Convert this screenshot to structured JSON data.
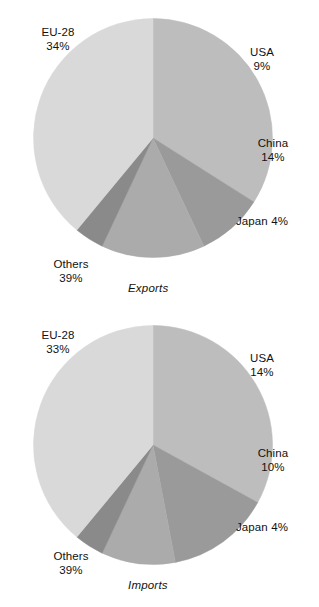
{
  "chart_data": [
    {
      "type": "pie",
      "title": "Exports",
      "caption": "Exports",
      "categories": [
        "EU-28",
        "USA",
        "China",
        "Japan",
        "Others"
      ],
      "values": [
        34,
        9,
        14,
        4,
        39
      ],
      "value_labels": [
        "34%",
        "9%",
        "14%",
        "4%",
        "39%"
      ],
      "unit": "%",
      "colors": [
        "#bdbdbd",
        "#9a9a9a",
        "#ababab",
        "#8a8a8a",
        "#d9d9d9"
      ],
      "legend": "none",
      "labels_position": "outside-callout",
      "start_angle_deg": 0,
      "direction": "clockwise",
      "slices": [
        {
          "name": "EU-28",
          "value": 34,
          "label": "EU-28",
          "pct": "34%",
          "color": "#bdbdbd"
        },
        {
          "name": "USA",
          "value": 9,
          "label": "USA",
          "pct": "9%",
          "color": "#9a9a9a"
        },
        {
          "name": "China",
          "value": 14,
          "label": "China",
          "pct": "14%",
          "color": "#ababab"
        },
        {
          "name": "Japan",
          "value": 4,
          "label": "Japan",
          "pct": "4%",
          "color": "#8a8a8a"
        },
        {
          "name": "Others",
          "value": 39,
          "label": "Others",
          "pct": "39%",
          "color": "#d9d9d9"
        }
      ]
    },
    {
      "type": "pie",
      "title": "Imports",
      "caption": "Imports",
      "categories": [
        "EU-28",
        "USA",
        "China",
        "Japan",
        "Others"
      ],
      "values": [
        33,
        14,
        10,
        4,
        39
      ],
      "value_labels": [
        "33%",
        "14%",
        "10%",
        "4%",
        "39%"
      ],
      "unit": "%",
      "colors": [
        "#bdbdbd",
        "#9a9a9a",
        "#ababab",
        "#8a8a8a",
        "#d9d9d9"
      ],
      "legend": "none",
      "labels_position": "outside-callout",
      "start_angle_deg": 0,
      "direction": "clockwise",
      "slices": [
        {
          "name": "EU-28",
          "value": 33,
          "label": "EU-28",
          "pct": "33%",
          "color": "#bdbdbd"
        },
        {
          "name": "USA",
          "value": 14,
          "label": "USA",
          "pct": "14%",
          "color": "#9a9a9a"
        },
        {
          "name": "China",
          "value": 10,
          "label": "China",
          "pct": "10%",
          "color": "#ababab"
        },
        {
          "name": "Japan",
          "value": 4,
          "label": "Japan",
          "pct": "4%",
          "color": "#8a8a8a"
        },
        {
          "name": "Others",
          "value": 39,
          "label": "Others",
          "pct": "39%",
          "color": "#d9d9d9"
        }
      ]
    }
  ],
  "exports": {
    "caption": "Exports",
    "labels": {
      "eu_name": "EU-28",
      "eu_pct": "34%",
      "usa_name": "USA",
      "usa_pct": "9%",
      "china_name": "China",
      "china_pct": "14%",
      "japan_name": "Japan ",
      "japan_pct": "4%",
      "others_name": "Others",
      "others_pct": "39%"
    }
  },
  "imports": {
    "caption": "Imports",
    "labels": {
      "eu_name": "EU-28",
      "eu_pct": "33%",
      "usa_name": "USA",
      "usa_pct": "14%",
      "china_name": "China",
      "china_pct": "10%",
      "japan_name": "Japan ",
      "japan_pct": "4%",
      "others_name": "Others",
      "others_pct": "39%"
    }
  }
}
